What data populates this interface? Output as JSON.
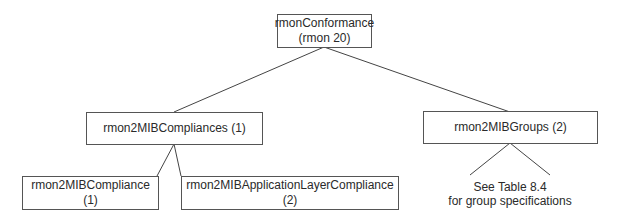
{
  "diagram": {
    "root": {
      "line1": "rmonConformance",
      "line2": "(rmon 20)"
    },
    "compliances": {
      "label": "rmon2MIBCompliances (1)"
    },
    "groups": {
      "label": "rmon2MIBGroups (2)"
    },
    "compliance": {
      "label": "rmon2MIBCompliance (1)"
    },
    "app_compliance": {
      "label": "rmon2MIBApplicationLayerCompliance (2)"
    },
    "groups_note": {
      "line1": "See Table 8.4",
      "line2": "for group specifications"
    }
  }
}
